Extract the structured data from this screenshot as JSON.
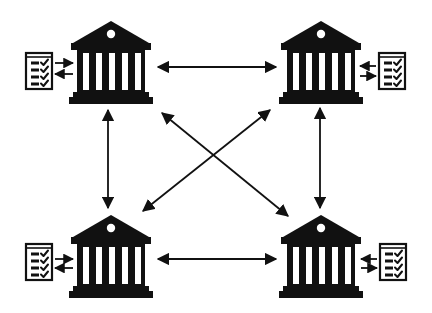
{
  "diagram": {
    "title": "Interconnected banks network with ledgers",
    "colors": {
      "ink": "#111111",
      "background": "#ffffff",
      "column_fill": "#ffffff"
    },
    "nodes": [
      {
        "id": "bank-top-left",
        "icon": "bank-building-icon",
        "cx": 111,
        "top": 21,
        "ledger": {
          "icon": "checklist-document-icon",
          "x": 25,
          "y": 52,
          "side": "left"
        }
      },
      {
        "id": "bank-top-right",
        "icon": "bank-building-icon",
        "cx": 321,
        "top": 21,
        "ledger": {
          "icon": "checklist-document-icon",
          "x": 378,
          "y": 52,
          "side": "right"
        }
      },
      {
        "id": "bank-bottom-left",
        "icon": "bank-building-icon",
        "cx": 111,
        "top": 215,
        "ledger": {
          "icon": "checklist-document-icon",
          "x": 25,
          "y": 243,
          "side": "left"
        }
      },
      {
        "id": "bank-bottom-right",
        "icon": "bank-building-icon",
        "cx": 321,
        "top": 215,
        "ledger": {
          "icon": "checklist-document-icon",
          "x": 379,
          "y": 243,
          "side": "right"
        }
      }
    ],
    "connections": [
      {
        "from": "bank-top-left",
        "to": "bank-top-right",
        "type": "bidirectional",
        "x1": 158,
        "y1": 67,
        "x2": 276,
        "y2": 67
      },
      {
        "from": "bank-bottom-left",
        "to": "bank-bottom-right",
        "type": "bidirectional",
        "x1": 158,
        "y1": 259,
        "x2": 276,
        "y2": 259
      },
      {
        "from": "bank-top-left",
        "to": "bank-bottom-left",
        "type": "bidirectional",
        "x1": 108,
        "y1": 110,
        "x2": 108,
        "y2": 208
      },
      {
        "from": "bank-top-right",
        "to": "bank-bottom-right",
        "type": "bidirectional",
        "x1": 320,
        "y1": 108,
        "x2": 320,
        "y2": 208
      },
      {
        "from": "bank-top-left",
        "to": "bank-bottom-right",
        "type": "bidirectional",
        "x1": 162,
        "y1": 113,
        "x2": 288,
        "y2": 216
      },
      {
        "from": "bank-top-right",
        "to": "bank-bottom-left",
        "type": "bidirectional",
        "x1": 270,
        "y1": 110,
        "x2": 143,
        "y2": 211
      }
    ],
    "ledger_links": [
      {
        "node": "bank-top-left",
        "out_y": 63,
        "in_y": 74,
        "x_doc": 55,
        "x_bank": 73
      },
      {
        "node": "bank-top-right",
        "out_y": 66,
        "in_y": 76,
        "x_doc": 376,
        "x_bank": 360
      },
      {
        "node": "bank-bottom-left",
        "out_y": 259,
        "in_y": 268,
        "x_doc": 55,
        "x_bank": 73
      },
      {
        "node": "bank-bottom-right",
        "out_y": 259,
        "in_y": 268,
        "x_doc": 377,
        "x_bank": 361
      }
    ]
  }
}
